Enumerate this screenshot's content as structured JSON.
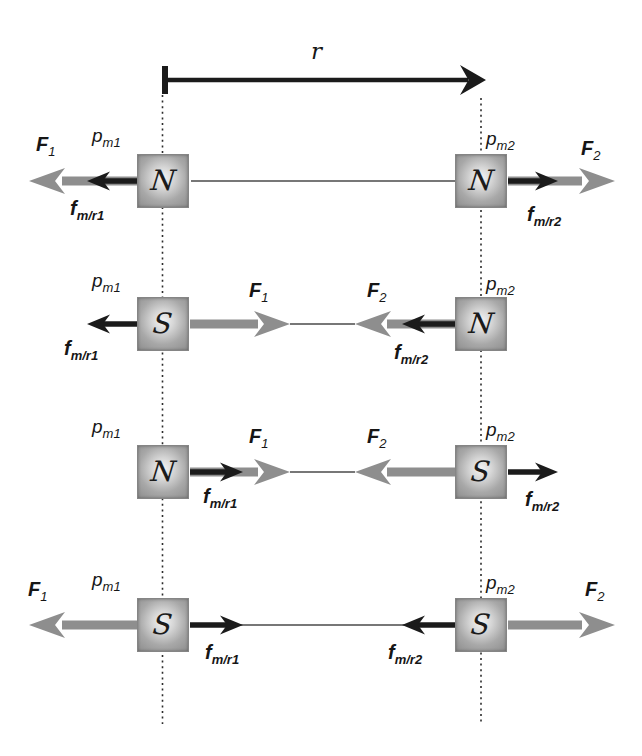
{
  "figure": {
    "distance_marker": {
      "label": {
        "main": "r"
      }
    },
    "colors": {
      "force_arrow_gray": "#8e8e8e",
      "unit_vector_arrow_black": "#1b1b1b",
      "pole_box_gray": "#a8a8a8",
      "background": "#ffffff"
    },
    "rows": [
      {
        "pole1": {
          "letter": "N",
          "label": {
            "main": "p",
            "sub": "m1"
          }
        },
        "pole2": {
          "letter": "N",
          "label": {
            "main": "p",
            "sub": "m2"
          }
        },
        "interaction": "repulsion",
        "F1": {
          "main": "F",
          "sub": "1",
          "direction": "left"
        },
        "F2": {
          "main": "F",
          "sub": "2",
          "direction": "right"
        },
        "fmr1": {
          "main": "f",
          "sub": "m/r1",
          "direction": "left"
        },
        "fmr2": {
          "main": "f",
          "sub": "m/r2",
          "direction": "right"
        }
      },
      {
        "pole1": {
          "letter": "S",
          "label": {
            "main": "p",
            "sub": "m1"
          }
        },
        "pole2": {
          "letter": "N",
          "label": {
            "main": "p",
            "sub": "m2"
          }
        },
        "interaction": "attraction",
        "F1": {
          "main": "F",
          "sub": "1",
          "direction": "right"
        },
        "F2": {
          "main": "F",
          "sub": "2",
          "direction": "left"
        },
        "fmr1": {
          "main": "f",
          "sub": "m/r1",
          "direction": "left"
        },
        "fmr2": {
          "main": "f",
          "sub": "m/r2",
          "direction": "left"
        }
      },
      {
        "pole1": {
          "letter": "N",
          "label": {
            "main": "p",
            "sub": "m1"
          }
        },
        "pole2": {
          "letter": "S",
          "label": {
            "main": "p",
            "sub": "m2"
          }
        },
        "interaction": "attraction",
        "F1": {
          "main": "F",
          "sub": "1",
          "direction": "right"
        },
        "F2": {
          "main": "F",
          "sub": "2",
          "direction": "left"
        },
        "fmr1": {
          "main": "f",
          "sub": "m/r1",
          "direction": "right"
        },
        "fmr2": {
          "main": "f",
          "sub": "m/r2",
          "direction": "right"
        }
      },
      {
        "pole1": {
          "letter": "S",
          "label": {
            "main": "p",
            "sub": "m1"
          }
        },
        "pole2": {
          "letter": "S",
          "label": {
            "main": "p",
            "sub": "m2"
          }
        },
        "interaction": "repulsion",
        "F1": {
          "main": "F",
          "sub": "1",
          "direction": "left"
        },
        "F2": {
          "main": "F",
          "sub": "2",
          "direction": "right"
        },
        "fmr1": {
          "main": "f",
          "sub": "m/r1",
          "direction": "right"
        },
        "fmr2": {
          "main": "f",
          "sub": "m/r2",
          "direction": "left"
        }
      }
    ]
  }
}
